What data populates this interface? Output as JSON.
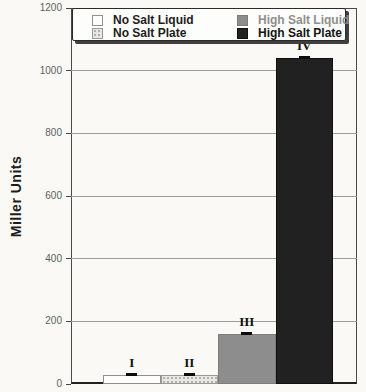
{
  "figure": {
    "width": 366,
    "height": 392,
    "background": "#faf9f5"
  },
  "chart_data": {
    "type": "bar",
    "title": "",
    "xlabel": "",
    "ylabel": "Miller Units",
    "ylim": [
      0,
      1200
    ],
    "yticks": [
      0,
      200,
      400,
      600,
      800,
      1000,
      1200
    ],
    "grid": "horizontal",
    "legend_position": "top-inside",
    "categories": [
      "I",
      "II",
      "III",
      "IV"
    ],
    "series": [
      {
        "name": "No Salt Liquid",
        "category": "I",
        "value": 30,
        "swatch": "white",
        "error_bar": true
      },
      {
        "name": "No Salt Plate",
        "category": "II",
        "value": 30,
        "swatch": "stipple",
        "error_bar": true
      },
      {
        "name": "High Salt Liquid",
        "category": "III",
        "value": 160,
        "swatch": "gray",
        "error_bar": true
      },
      {
        "name": "High Salt Plate",
        "category": "IV",
        "value": 1040,
        "swatch": "black",
        "error_bar": true
      }
    ]
  },
  "legend": {
    "items": [
      {
        "label": "No Salt Liquid",
        "swatch": "white",
        "text_color": "#1c1c1c",
        "column": 1,
        "row": 1
      },
      {
        "label": "No Salt Plate",
        "swatch": "stipple",
        "text_color": "#1c1c1c",
        "column": 1,
        "row": 2
      },
      {
        "label": "High Salt Liquid",
        "swatch": "gray",
        "text_color": "#8e8e8e",
        "column": 2,
        "row": 1
      },
      {
        "label": "High Salt Plate",
        "swatch": "black",
        "text_color": "#141414",
        "column": 2,
        "row": 2
      }
    ]
  },
  "colors": {
    "bar_white": "#fdfdfc",
    "bar_stipple_base": "#e8e7e2",
    "bar_stipple_dot": "#b2b1ac",
    "bar_gray": "#8d8d8d",
    "bar_black": "#212121",
    "gridline": "#9b9b9b",
    "axis": "#4a4a4a",
    "tick_label": "#5f5f5f"
  }
}
